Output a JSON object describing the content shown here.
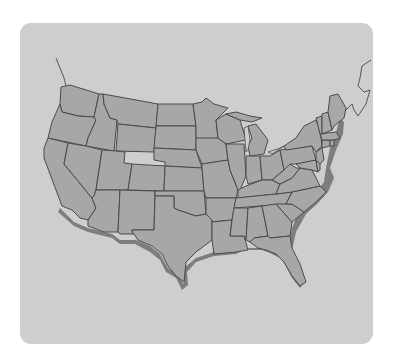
{
  "figure": {
    "type": "map",
    "labels": [],
    "colors": {
      "card_background": "#cecece",
      "state_fill": "#a7a7a7",
      "state_border": "#4a4a4a",
      "shadow": "#6e6e6e"
    }
  },
  "states": [
    "WA",
    "OR",
    "CA",
    "ID",
    "NV",
    "MT",
    "WY",
    "UT",
    "AZ",
    "CO",
    "NM",
    "ND",
    "SD",
    "NE",
    "KS",
    "OK",
    "TX",
    "MN",
    "IA",
    "MO",
    "AR",
    "LA",
    "WI",
    "IL",
    "MI",
    "IN",
    "OH",
    "KY",
    "TN",
    "MS",
    "AL",
    "GA",
    "FL",
    "SC",
    "NC",
    "VA",
    "WV",
    "PA",
    "NY",
    "MD",
    "DE",
    "NJ",
    "CT",
    "RI",
    "MA",
    "VT",
    "NH",
    "ME"
  ]
}
